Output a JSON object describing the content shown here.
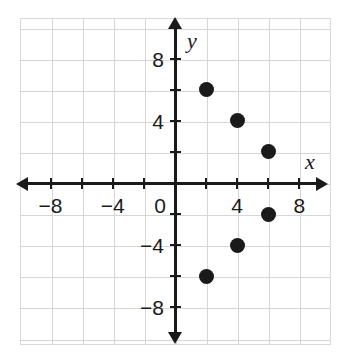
{
  "chart_data": {
    "type": "scatter",
    "title": "",
    "xlabel": "x",
    "ylabel": "y",
    "xlim": [
      -10,
      10
    ],
    "ylim": [
      -10,
      10
    ],
    "grid": true,
    "legend": "none",
    "point_color": "#1a1a1a",
    "axis_color": "#1a1a1a",
    "grid_color": "#d6d6d6",
    "x_tick_values": [
      -8,
      -6,
      -4,
      -2,
      0,
      2,
      4,
      6,
      8
    ],
    "y_tick_values": [
      -8,
      -6,
      -4,
      -2,
      2,
      4,
      6,
      8
    ],
    "x_tick_labels": [
      {
        "value": -8,
        "text": "−8"
      },
      {
        "value": -4,
        "text": "−4"
      },
      {
        "value": 0,
        "text": "0"
      },
      {
        "value": 4,
        "text": "4"
      },
      {
        "value": 8,
        "text": "8"
      }
    ],
    "y_tick_labels": [
      {
        "value": 8,
        "text": "8"
      },
      {
        "value": 4,
        "text": "4"
      },
      {
        "value": -4,
        "text": "−4"
      },
      {
        "value": -8,
        "text": "−8"
      }
    ],
    "points": [
      {
        "x": 2,
        "y": 6
      },
      {
        "x": 4,
        "y": 4
      },
      {
        "x": 6,
        "y": 2
      },
      {
        "x": 6,
        "y": -2
      },
      {
        "x": 4,
        "y": -4
      },
      {
        "x": 2,
        "y": -6
      }
    ]
  }
}
